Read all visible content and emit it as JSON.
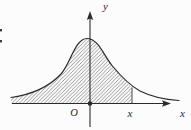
{
  "figure": {
    "type": "normal-distribution-curve-sketch",
    "labels": {
      "y_axis": "y",
      "x_axis": "x",
      "origin": "O",
      "boundary_point": "x"
    },
    "content": {
      "curve": "bell-shaped density curve peaking above the origin",
      "shaded_region": "diagonally hatched area under the curve from the left tail up to the vertical line at point x"
    },
    "colors": {
      "background": "#fcfcfc",
      "ink": "#2b2b2b",
      "hatch": "#6f6f6f"
    }
  }
}
